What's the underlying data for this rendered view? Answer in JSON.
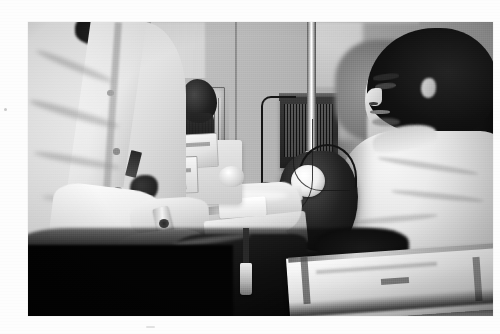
{
  "document": {
    "type": "photograph",
    "color_mode": "black-and-white",
    "orientation": "landscape",
    "background_color": "#fdfdfd",
    "caption": "Black-and-white photograph of a blood donation or blood draw in a clinic: a seated patient in a light sweatshirt reclines at right with a blood pressure cuff on his upper arm while a technician in a white lab coat tends to his extended forearm."
  },
  "photo": {
    "alt": "Clinic blood draw scene in black and white",
    "frame": {
      "x": 28,
      "y": 22,
      "width": 465,
      "height": 294
    },
    "tone": {
      "highlight": "#ffffff",
      "midtone": "#b5b2ab",
      "shadow": "#070706"
    }
  },
  "scene": {
    "setting": "clinic blood donation room",
    "lighting": "overhead clinical light, bright on subjects, deep shadow in lower-left foreground",
    "subjects": [
      {
        "id": "technician",
        "label": "Technician in white lab coat",
        "position": "left foreground, back partly to camera",
        "details": "White buttoned lab coat with visible lapel and three buttons; dark hair at top edge; pen and dark stethoscope bell in chest pocket; both hands extended toward the patient's forearm; wristwatch on left wrist"
      },
      {
        "id": "patient",
        "label": "Reclining patient",
        "position": "right side, head resting back on chair headrest",
        "details": "Dark shoulder-length hair, face in profile looking left with eyes lowered; pale light-colored sweatshirt; left arm extended toward technician; papers or a magazine resting on lap"
      }
    ],
    "objects": [
      {
        "id": "bp-cuff",
        "label": "Blood pressure cuff",
        "note": "Dark cuff wrapped around the patient's upper arm with a round white gauge dial and looped black tubing"
      },
      {
        "id": "sphyg-bulb",
        "label": "Inflation bulb",
        "note": "Black rubber squeeze bulb hanging on tubing near the IV pole"
      },
      {
        "id": "iv-pole",
        "label": "IV pole",
        "note": "Vertical chrome rod running the full height of the frame at center"
      },
      {
        "id": "supply-kit",
        "label": "Supply boxes and kit",
        "note": "Stack of light cardboard supply boxes and tubing tray beside the patient's forearm"
      },
      {
        "id": "wire-basket",
        "label": "Wall-mounted wire basket",
        "note": "Chrome wire basket on the back wall holding dark contents"
      },
      {
        "id": "wall-unit",
        "label": "Dark wall-mounted unit",
        "note": "Dark louvered box fixed to the wall behind the IV pole"
      },
      {
        "id": "tubing",
        "label": "Blood collection tubing",
        "note": "Dark tubing running from the patient's arm down to a clamp and collection bag in the shadowed foreground"
      },
      {
        "id": "tape",
        "label": "Adhesive tape",
        "note": "White tape strip on the patient's forearm at the venipuncture site"
      },
      {
        "id": "papers",
        "label": "Papers / magazine",
        "note": "Light pages angled across the patient's lap at lower right"
      },
      {
        "id": "pipe",
        "label": "Vertical pipe",
        "note": "White vertical pipe with a banded collar on the left background wall"
      }
    ]
  }
}
